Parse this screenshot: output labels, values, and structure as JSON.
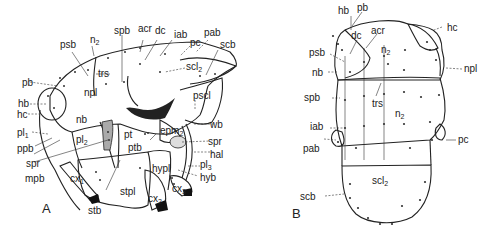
{
  "figure": {
    "panels": [
      {
        "id": "A",
        "label": "A",
        "view": "lateral thorax",
        "structure_labels": [
          "n2",
          "spb",
          "acr",
          "dc",
          "iab",
          "pab",
          "psb",
          "pc",
          "scb",
          "trs",
          "scl2",
          "pb",
          "npl",
          "pscl",
          "hb",
          "hc",
          "nb",
          "pl1",
          "pl2",
          "pt",
          "epm2",
          "wb",
          "ppb",
          "ptb",
          "spr",
          "hal",
          "spr",
          "mpb",
          "hypl",
          "pl3",
          "hyb",
          "cx1",
          "stpl",
          "cx2",
          "cx3",
          "stb"
        ]
      },
      {
        "id": "B",
        "label": "B",
        "view": "dorsal thorax",
        "structure_labels": [
          "hb",
          "pb",
          "psb",
          "dc",
          "acr",
          "hc",
          "nb",
          "n2",
          "npl",
          "spb",
          "trs",
          "n2",
          "iab",
          "pab",
          "pc",
          "scl2",
          "scb"
        ]
      }
    ]
  },
  "A": {
    "n2": "n",
    "n2_sub": "2",
    "spb": "spb",
    "acr": "acr",
    "dc": "dc",
    "iab": "iab",
    "pab": "pab",
    "psb": "psb",
    "pc": "pc",
    "scb": "scb",
    "trs": "trs",
    "scl2": "scl",
    "scl2_sub": "2",
    "pb": "pb",
    "npl": "npl",
    "pscl": "pscl",
    "hb": "hb",
    "hc": "hc",
    "nb": "nb",
    "pl1": "pl",
    "pl1_sub": "1",
    "pl2": "pl",
    "pl2_sub": "2",
    "pt": "pt",
    "epm2": "epm",
    "epm2_sub": "2",
    "wb": "wb",
    "ppb": "ppb",
    "ptb": "ptb",
    "spr1": "spr",
    "spr2": "spr",
    "hal": "hal",
    "mpb": "mpb",
    "hypl": "hypl",
    "pl3": "pl",
    "pl3_sub": "3",
    "hyb": "hyb",
    "cx1": "cx",
    "cx1_sub": "1",
    "stpl": "stpl",
    "cx2": "cx",
    "cx2_sub": "2",
    "cx3": "cx",
    "cx3_sub": "3",
    "stb": "stb",
    "panel": "A"
  },
  "B": {
    "hb": "hb",
    "pb": "pb",
    "psb": "psb",
    "dc": "dc",
    "acr": "acr",
    "hc": "hc",
    "nb": "nb",
    "n2a": "n",
    "n2a_sub": "2",
    "npl": "npl",
    "spb": "spb",
    "trs": "trs",
    "n2b": "n",
    "n2b_sub": "2",
    "iab": "iab",
    "pab": "pab",
    "pc": "pc",
    "scl2": "scl",
    "scl2_sub": "2",
    "scb": "scb",
    "panel": "B"
  }
}
